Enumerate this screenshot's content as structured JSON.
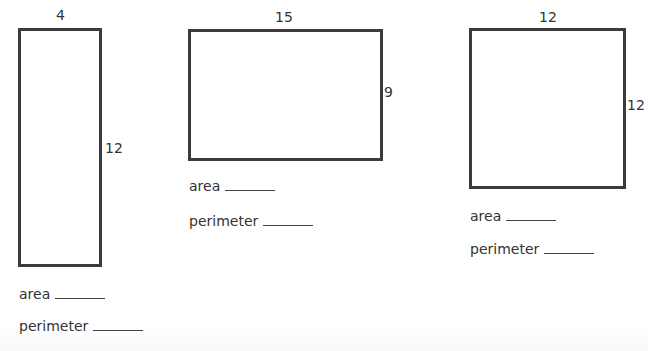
{
  "worksheet": {
    "rectangles": [
      {
        "width": "4",
        "height": "12",
        "area_label": "area",
        "perimeter_label": "perimeter"
      },
      {
        "width": "15",
        "height": "9",
        "area_label": "area",
        "perimeter_label": "perimeter"
      },
      {
        "width": "12",
        "height": "12",
        "area_label": "area",
        "perimeter_label": "perimeter"
      }
    ]
  }
}
